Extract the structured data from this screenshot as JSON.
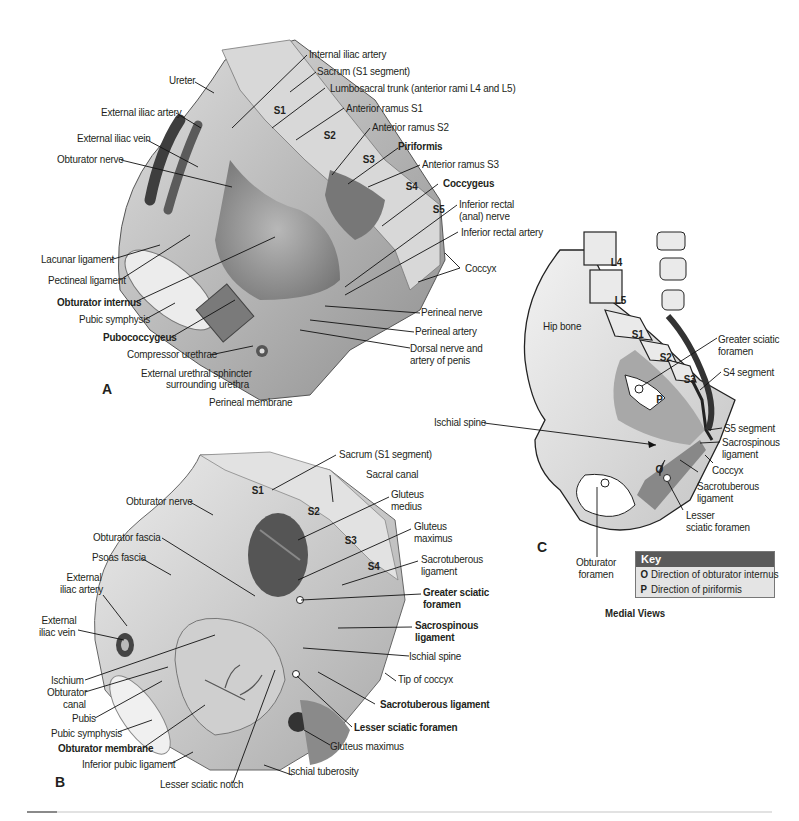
{
  "figure": {
    "panels": {
      "A": {
        "letter": "A",
        "labels": {
          "internal_iliac_artery": "Internal iliac artery",
          "sacrum_s1": "Sacrum (S1 segment)",
          "lumbosacral_trunk": "Lumbosacral trunk (anterior rami L4 and L5)",
          "ureter": "Ureter",
          "anterior_ramus_s1": "Anterior ramus S1",
          "external_iliac_artery": "External iliac artery",
          "anterior_ramus_s2": "Anterior ramus S2",
          "external_iliac_vein": "External iliac vein",
          "piriformis": "Piriformis",
          "obturator_nerve": "Obturator nerve",
          "anterior_ramus_s3": "Anterior ramus S3",
          "coccygeus": "Coccygeus",
          "inferior_rectal_nerve_1": "Inferior rectal",
          "inferior_rectal_nerve_2": "(anal) nerve",
          "inferior_rectal_artery": "Inferior rectal artery",
          "lacunar_ligament": "Lacunar ligament",
          "coccyx": "Coccyx",
          "pectineal_ligament": "Pectineal ligament",
          "obturator_internus": "Obturator internus",
          "pubic_symphysis": "Pubic symphysis",
          "perineal_nerve": "Perineal nerve",
          "pubococcygeus": "Pubococcygeus",
          "perineal_artery": "Perineal artery",
          "compressor_urethrae": "Compressor urethrae",
          "dorsal_nerve_1": "Dorsal nerve and",
          "dorsal_nerve_2": "artery of penis",
          "ext_urethral_sphincter_1": "External urethral sphincter",
          "ext_urethral_sphincter_2": "surrounding urethra",
          "perineal_membrane": "Perineal membrane"
        },
        "segments": [
          "S1",
          "S2",
          "S3",
          "S4",
          "S5"
        ]
      },
      "B": {
        "letter": "B",
        "labels": {
          "sacrum_s1": "Sacrum (S1 segment)",
          "sacral_canal": "Sacral canal",
          "obturator_nerve": "Obturator nerve",
          "gluteus_medius_1": "Gluteus",
          "gluteus_medius_2": "medius",
          "obturator_fascia": "Obturator fascia",
          "gluteus_maximus_1": "Gluteus",
          "gluteus_maximus_2": "maximus",
          "psoas_fascia": "Psoas fascia",
          "sacrotuberous_1": "Sacrotuberous",
          "sacrotuberous_2": "ligament",
          "external_iliac_artery_1": "External",
          "external_iliac_artery_2": "iliac artery",
          "greater_sciatic_1": "Greater sciatic",
          "greater_sciatic_2": "foramen",
          "external_iliac_vein_1": "External",
          "external_iliac_vein_2": "iliac vein",
          "sacrospinous_1": "Sacrospinous",
          "sacrospinous_2": "ligament",
          "ischial_spine": "Ischial spine",
          "ischium": "Ischium",
          "tip_of_coccyx": "Tip of coccyx",
          "obturator_canal_1": "Obturator",
          "obturator_canal_2": "canal",
          "sacrotuberous_ligament": "Sacrotuberous ligament",
          "pubis": "Pubis",
          "lesser_sciatic_foramen": "Lesser sciatic foramen",
          "pubic_symphysis": "Pubic symphysis",
          "obturator_membrane": "Obturator membrane",
          "gluteus_maximus": "Gluteus maximus",
          "inferior_pubic_ligament": "Inferior pubic ligament",
          "ischial_tuberosity": "Ischial tuberosity",
          "lesser_sciatic_notch": "Lesser sciatic notch"
        },
        "segments": [
          "S1",
          "S2",
          "S3",
          "S4"
        ]
      },
      "C": {
        "letter": "C",
        "labels": {
          "hip_bone": "Hip bone",
          "greater_sciatic_1": "Greater sciatic",
          "greater_sciatic_2": "foramen",
          "s4_segment": "S4 segment",
          "ischial_spine": "Ischial spine",
          "s5_segment": "S5 segment",
          "sacrospinous_1": "Sacrospinous",
          "sacrospinous_2": "ligament",
          "coccyx": "Coccyx",
          "sacrotuberous_1": "Sacrotuberous",
          "sacrotuberous_2": "ligament",
          "lesser_sciatic_1": "Lesser",
          "lesser_sciatic_2": "sciatic foramen",
          "obturator_foramen_1": "Obturator",
          "obturator_foramen_2": "foramen",
          "marker_p": "P",
          "marker_o": "O"
        },
        "segments": [
          "L4",
          "L5",
          "S1",
          "S2",
          "S3"
        ]
      }
    },
    "key": {
      "title": "Key",
      "items": [
        {
          "code": "O",
          "text": "Direction of obturator internus"
        },
        {
          "code": "P",
          "text": "Direction of piriformis"
        }
      ]
    },
    "caption": "Medial Views",
    "colors": {
      "key_header": "#5a5a5a",
      "key_body": "#e4e4e4",
      "illustration_dark": "#4a4a4a",
      "illustration_mid": "#9a9a9a",
      "illustration_light": "#d6d6d6"
    }
  }
}
